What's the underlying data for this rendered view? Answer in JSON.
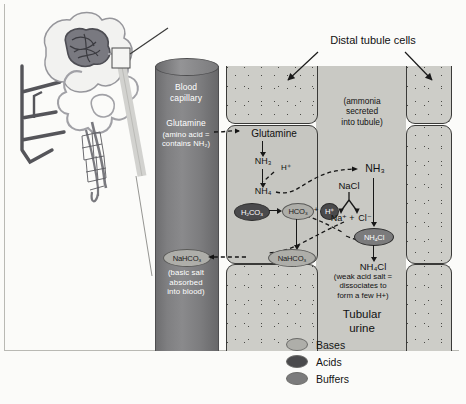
{
  "figure": {
    "top_label": "Distal tubule cells"
  },
  "capillary": {
    "name_line1": "Blood",
    "name_line2": "capillary",
    "glutamine_label": "Glutamine",
    "glutamine_note_line1": "(amino acid =",
    "glutamine_note_line2": "contains NH₂)",
    "nahco3_label": "NaHCO₃",
    "nahco3_note_line1": "(basic salt",
    "nahco3_note_line2": "absorbed",
    "nahco3_note_line3": "into blood)"
  },
  "cell": {
    "glutamine": "Glutamine",
    "nh3": "NH₃",
    "h_plus": "H⁺",
    "nh4": "NH₄",
    "h2co3": "H₂CO₃",
    "hco3": "HCO₃",
    "h_plus_mol": "H⁺",
    "nahco3": "NaHCO₃"
  },
  "lumen": {
    "secretion_note_line1": "(ammonia",
    "secretion_note_line2": "secreted",
    "secretion_note_line3": "into tubule)",
    "nh3": "NH₃",
    "nacl": "NaCl",
    "na_plus": "Na⁺",
    "plus": "+",
    "cl_minus": "Cl⁻",
    "nh4cl_mol": "NH₄Cl",
    "nh4cl_label": "NH₄Cl",
    "nh4cl_note_line1": "(weak acid salt =",
    "nh4cl_note_line2": "dissociates to",
    "nh4cl_note_line3": "form a few H+)",
    "urine_line1": "Tubular",
    "urine_line2": "urine"
  },
  "legend": {
    "items": [
      {
        "label": "Bases",
        "color": "#aeaea9"
      },
      {
        "label": "Acids",
        "color": "#4a4a4c"
      },
      {
        "label": "Buffers",
        "color": "#7b7b7c"
      }
    ]
  },
  "colors": {
    "acid": "#4a4a4c",
    "base": "#aeaea9",
    "buffer": "#7b7b7c",
    "capillary": "#7f7f81",
    "cell": "#c6c6c1",
    "stipple": "#cdcdc8",
    "background": "#fbfbf9"
  }
}
